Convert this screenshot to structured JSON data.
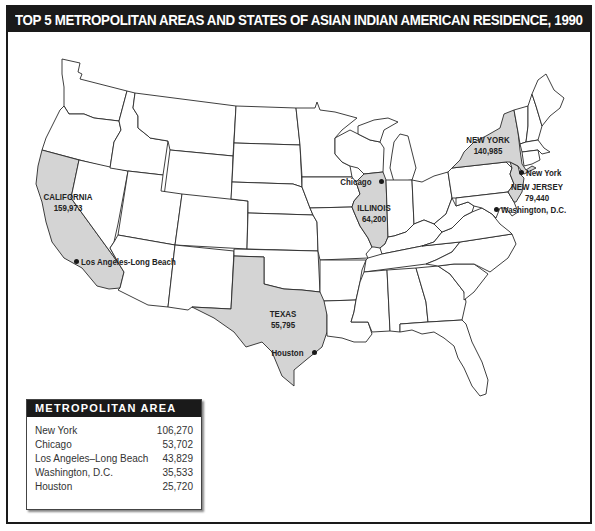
{
  "title": "TOP 5 METROPOLITAN AREAS AND STATES OF ASIAN INDIAN AMERICAN RESIDENCE, 1990",
  "colors": {
    "title_bar": "#1a1a1a",
    "highlight_state_fill": "#d4d4d4",
    "state_fill": "#ffffff",
    "border": "#2a2a2a"
  },
  "states": [
    {
      "name": "CALIFORNIA",
      "value": "159,973"
    },
    {
      "name": "NEW YORK",
      "value": "140,985"
    },
    {
      "name": "NEW JERSEY",
      "value": "79,440"
    },
    {
      "name": "ILLINOIS",
      "value": "64,200"
    },
    {
      "name": "TEXAS",
      "value": "55,795"
    }
  ],
  "cities": [
    {
      "name": "New York"
    },
    {
      "name": "Chicago"
    },
    {
      "name": "Los Angeles-Long Beach"
    },
    {
      "name": "Washington, D.C."
    },
    {
      "name": "Houston"
    }
  ],
  "legend": {
    "header": "METROPOLITAN AREA",
    "rows": [
      {
        "area": "New York",
        "value": "106,270"
      },
      {
        "area": "Chicago",
        "value": "53,702"
      },
      {
        "area": "Los Angeles–Long Beach",
        "value": "43,829"
      },
      {
        "area": "Washington, D.C.",
        "value": "35,533"
      },
      {
        "area": "Houston",
        "value": "25,720"
      }
    ]
  }
}
